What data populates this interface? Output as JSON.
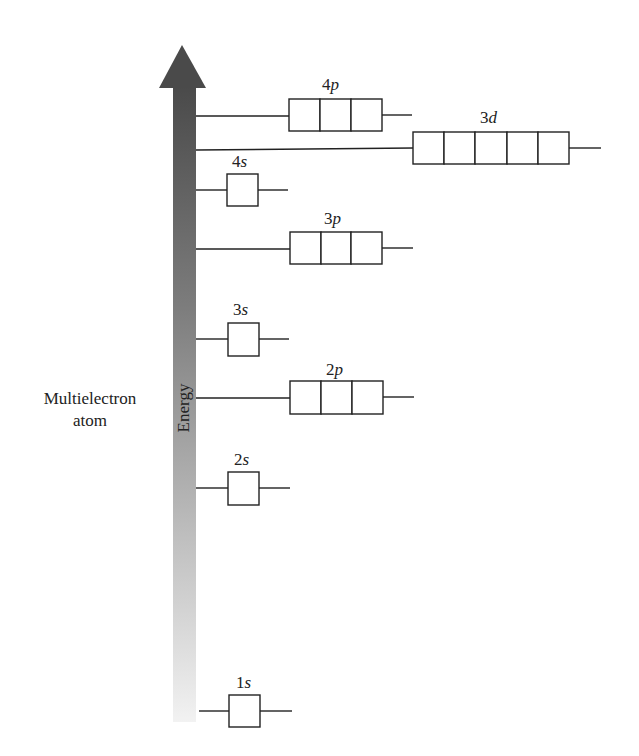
{
  "side_label": {
    "line1": "Multielectron",
    "line2": "atom"
  },
  "axis": {
    "label": "Energy",
    "direction": "up",
    "gradient_top": "#4a4a4a",
    "gradient_bottom": "#f2f2f2"
  },
  "orbitals": [
    {
      "id": "1s",
      "n": "1",
      "l": "s",
      "boxes": 1,
      "level_y": 711
    },
    {
      "id": "2s",
      "n": "2",
      "l": "s",
      "boxes": 1,
      "level_y": 488
    },
    {
      "id": "2p",
      "n": "2",
      "l": "p",
      "boxes": 3,
      "level_y": 398
    },
    {
      "id": "3s",
      "n": "3",
      "l": "s",
      "boxes": 1,
      "level_y": 339
    },
    {
      "id": "3p",
      "n": "3",
      "l": "p",
      "boxes": 3,
      "level_y": 248
    },
    {
      "id": "4s",
      "n": "4",
      "l": "s",
      "boxes": 1,
      "level_y": 189
    },
    {
      "id": "3d",
      "n": "3",
      "l": "d",
      "boxes": 5,
      "level_y": 149
    },
    {
      "id": "4p",
      "n": "4",
      "l": "p",
      "boxes": 3,
      "level_y": 116
    }
  ],
  "energy_order": [
    "1s",
    "2s",
    "2p",
    "3s",
    "3p",
    "4s",
    "3d",
    "4p"
  ]
}
